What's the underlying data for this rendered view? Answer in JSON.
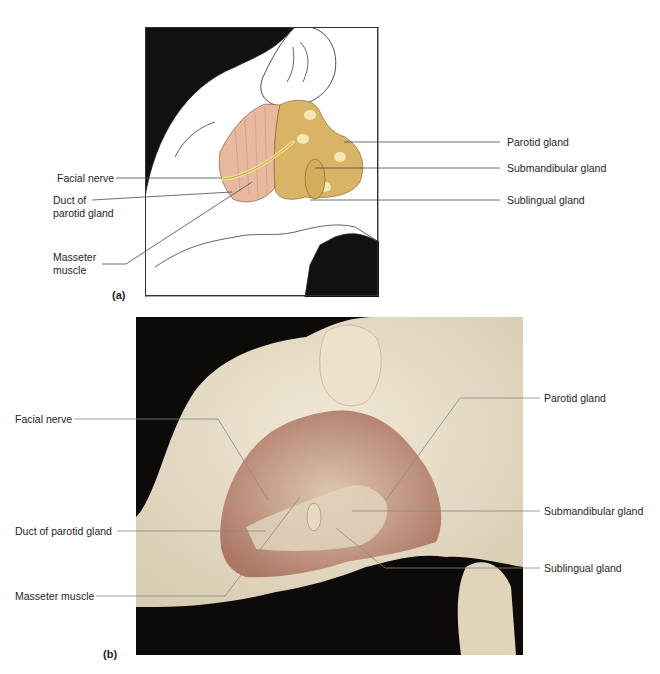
{
  "figure": {
    "panel_a": {
      "tag": "(a)",
      "style": "illustration",
      "labels": {
        "facial_nerve": "Facial nerve",
        "duct_line1": "Duct of",
        "duct_line2": "parotid gland",
        "masseter_line1": "Masseter",
        "masseter_line2": "muscle",
        "parotid": "Parotid gland",
        "submandibular": "Submandibular gland",
        "sublingual": "Sublingual gland"
      },
      "colors": {
        "background": "#111111",
        "muscle": "#e8b8a0",
        "gland": "#d9b466",
        "nerve": "#f2df8a"
      }
    },
    "panel_b": {
      "tag": "(b)",
      "style": "photograph",
      "labels": {
        "facial_nerve": "Facial nerve",
        "duct": "Duct of parotid gland",
        "masseter": "Masseter muscle",
        "parotid": "Parotid gland",
        "submandibular": "Submandibular gland",
        "sublingual": "Sublingual gland"
      },
      "colors": {
        "background": "#0d0b0a",
        "tissue": "#e6dcc6",
        "dissection": "#c9a38f"
      }
    }
  }
}
